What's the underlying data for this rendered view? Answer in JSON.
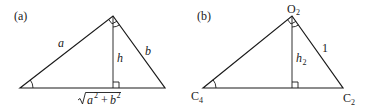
{
  "panels": [
    {
      "id": "a",
      "panel_label": "(a)",
      "side_left_label": "a",
      "side_right_label": "b",
      "altitude_label": "h",
      "base_label": {
        "radical": "√",
        "term1": "a",
        "exp1": "2",
        "plus": "+",
        "term2": "b",
        "exp2": "2"
      },
      "vertices": {
        "left": [
          20,
          88
        ],
        "apex": [
          113,
          16
        ],
        "right": [
          165,
          88
        ]
      },
      "markers": [
        "right-angle-at-apex",
        "angle-arc-at-apex-right",
        "angle-arc-at-left-vertex",
        "right-angle-at-foot"
      ]
    },
    {
      "id": "b",
      "panel_label": "(b)",
      "apex_label": {
        "base": "O",
        "sub": "2"
      },
      "left_vertex_label": {
        "base": "C",
        "sub": "4"
      },
      "right_vertex_label": {
        "base": "C",
        "sub": "2"
      },
      "side_right_label": "1",
      "altitude_label": {
        "base": "h",
        "sub": "2"
      },
      "vertices": {
        "left": [
          203,
          88
        ],
        "apex": [
          292,
          16
        ],
        "right": [
          343,
          88
        ]
      },
      "markers": [
        "right-angle-at-apex",
        "angle-arc-at-apex-right",
        "angle-arc-at-left-vertex",
        "right-angle-at-foot"
      ]
    }
  ]
}
